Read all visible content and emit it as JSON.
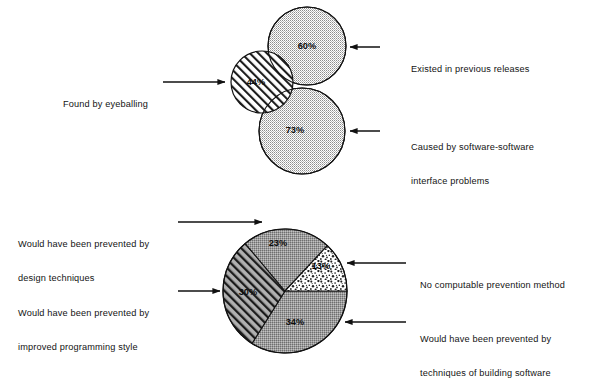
{
  "figure": {
    "background_color": "#ffffff",
    "ink_color": "#111111"
  },
  "venn": {
    "name": "Venn diagram of software error causes",
    "circles": [
      {
        "id": "existed-previous",
        "percent_label": "60%",
        "value": 60,
        "fill_pattern": "fine-grid",
        "fill_color": "#dedede",
        "cx": 307,
        "cy": 46,
        "r": 39
      },
      {
        "id": "found-eyeballing",
        "percent_label": "44%",
        "value": 44,
        "fill_pattern": "diagonal-hatch",
        "fill_color": "#ffffff",
        "cx": 262,
        "cy": 82,
        "r": 31
      },
      {
        "id": "interface-problems",
        "percent_label": "73%",
        "value": 73,
        "fill_pattern": "fine-grid",
        "fill_color": "#dcdcdc",
        "cx": 302,
        "cy": 131,
        "r": 43
      }
    ],
    "callouts": [
      {
        "id": "callout-existed-previous",
        "text": "Existed in previous releases",
        "lines": [
          "Existed in previous releases"
        ],
        "side": "right"
      },
      {
        "id": "callout-interface-problems",
        "text": "Caused by software-software interface problems",
        "lines": [
          "Caused by software-software",
          "interface problems"
        ],
        "side": "right"
      },
      {
        "id": "callout-found-eyeballing",
        "text": "Found by eyeballing",
        "lines": [
          "Found by eyeballing"
        ],
        "side": "left"
      }
    ]
  },
  "pie": {
    "name": "Pie chart of prevention methods",
    "cx": 285,
    "cy": 291,
    "r": 62,
    "slices": [
      {
        "id": "techniques-building-software",
        "percent_label": "34%",
        "value": 34,
        "fill_pattern": "fine-grid",
        "fill_color": "#b4b4b4",
        "start_deg": 0,
        "end_deg": 122
      },
      {
        "id": "improved-programming-style",
        "percent_label": "30%",
        "value": 30,
        "fill_pattern": "diagonal-hatch",
        "fill_color": "#a8a8a8",
        "start_deg": 122,
        "end_deg": 230
      },
      {
        "id": "design-techniques",
        "percent_label": "23%",
        "value": 23,
        "fill_pattern": "fine-grid",
        "fill_color": "#b0b0b0",
        "start_deg": 230,
        "end_deg": 313
      },
      {
        "id": "no-computable-prevention",
        "percent_label": "13%",
        "value": 13,
        "fill_pattern": "speckle",
        "fill_color": "#fdfdfd",
        "start_deg": 313,
        "end_deg": 360
      }
    ],
    "callouts": [
      {
        "id": "callout-design-techniques",
        "text": "Would have been prevented by design techniques",
        "lines": [
          "Would have been prevented by",
          "design techniques"
        ],
        "side": "left"
      },
      {
        "id": "callout-improved-programming-style",
        "text": "Would have been prevented by improved programming style",
        "lines": [
          "Would have been prevented by",
          "improved programming style"
        ],
        "side": "left"
      },
      {
        "id": "callout-no-computable-prevention",
        "text": "No computable prevention method",
        "lines": [
          "No computable prevention method"
        ],
        "side": "right"
      },
      {
        "id": "callout-techniques-building-software",
        "text": "Would have been prevented by techniques of building software",
        "lines": [
          "Would have been prevented by",
          "techniques of building software"
        ],
        "side": "right"
      }
    ]
  }
}
